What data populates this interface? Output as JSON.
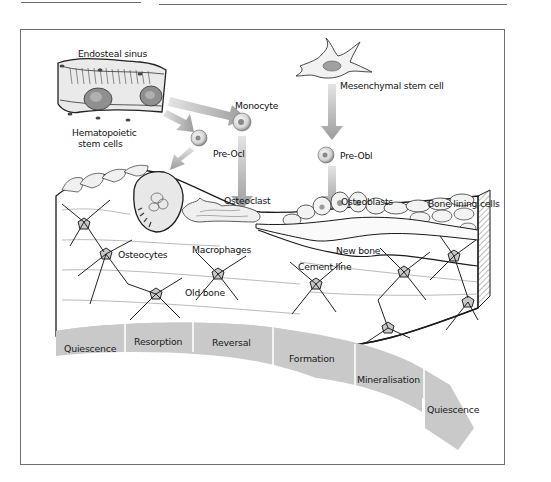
{
  "figure": {
    "labels": {
      "endosteal_sinus": "Endosteal sinus",
      "hematopoietic_1": "Hematopoietic",
      "hematopoietic_2": "stem cells",
      "monocyte": "Monocyte",
      "pre_ocl": "Pre-Ocl",
      "mesenchymal": "Mesenchymal stem cell",
      "pre_obl": "Pre-Obl",
      "osteoclast": "Osteoclast",
      "osteoblasts": "Osteoblasts",
      "bone_lining_cells": "Bone lining cells",
      "osteocytes": "Osteocytes",
      "macrophages": "Macrophages",
      "new_bone": "New bone",
      "cement_line": "Cement line",
      "old_bone": "Old bone"
    },
    "stages": [
      {
        "label": "Quiescence"
      },
      {
        "label": "Resorption"
      },
      {
        "label": "Reversal"
      },
      {
        "label": "Formation"
      },
      {
        "label": "Mineralisation"
      },
      {
        "label": "Quiescence"
      }
    ],
    "colors": {
      "stage_band": "#c9c9c9",
      "arrow": "#a9a9a9",
      "cell_nucleus": "#8a8a8a",
      "frame": "#6e6e6e"
    }
  }
}
